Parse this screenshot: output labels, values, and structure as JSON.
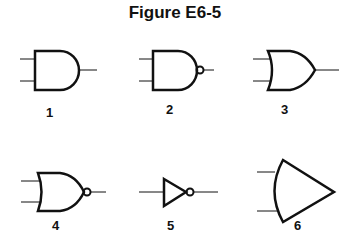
{
  "title": "Figure E6-5",
  "gates": [
    {
      "label": "1",
      "type": "AND"
    },
    {
      "label": "2",
      "type": "NAND"
    },
    {
      "label": "3",
      "type": "OR"
    },
    {
      "label": "4",
      "type": "NOR"
    },
    {
      "label": "5",
      "type": "NOT"
    },
    {
      "label": "6",
      "type": "unconventional gate shape"
    }
  ]
}
